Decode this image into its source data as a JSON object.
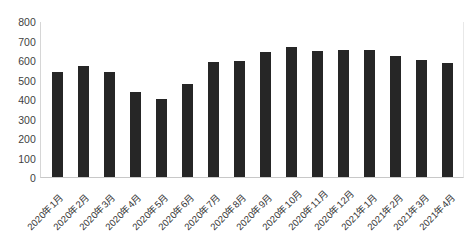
{
  "chart_data": {
    "type": "bar",
    "title": "",
    "subtitle": "",
    "xlabel": "",
    "ylabel": "",
    "ylim": [
      0,
      800
    ],
    "ytick_step": 100,
    "grid": false,
    "legend": false,
    "legend_position": "none",
    "bar_color": "#262626",
    "categories": [
      "2020年1月",
      "2020年2月",
      "2020年3月",
      "2020年4月",
      "2020年5月",
      "2020年6月",
      "2020年7月",
      "2020年8月",
      "2020年9月",
      "2020年10月",
      "2020年11月",
      "2020年12月",
      "2021年1月",
      "2021年2月",
      "2021年3月",
      "2021年4月"
    ],
    "values": [
      540,
      568,
      536,
      435,
      400,
      476,
      590,
      594,
      640,
      665,
      645,
      652,
      652,
      620,
      600,
      585
    ],
    "ytick_labels": [
      "800",
      "700",
      "600",
      "500",
      "400",
      "300",
      "200",
      "100",
      "0"
    ],
    "ytick_values": [
      800,
      700,
      600,
      500,
      400,
      300,
      200,
      100,
      0
    ]
  }
}
